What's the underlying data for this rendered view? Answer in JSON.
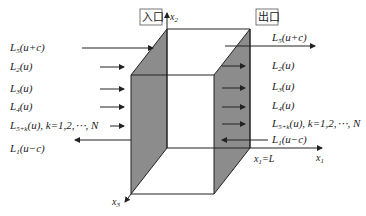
{
  "diagram": {
    "inlet_label": "入口",
    "outlet_label": "出口",
    "axes": {
      "x1": "x",
      "x1_sub": "1",
      "x2": "x",
      "x2_sub": "2",
      "x3": "x",
      "x3_sub": "3",
      "boundary": "x",
      "boundary_sub": "1",
      "boundary_value": "=L"
    },
    "left_waves": [
      {
        "L": "L",
        "sub": "5",
        "arg": "(u+c)",
        "direction": "in"
      },
      {
        "L": "L",
        "sub": "2",
        "arg": "(u)",
        "direction": "in"
      },
      {
        "L": "L",
        "sub": "3",
        "arg": "(u)",
        "direction": "in"
      },
      {
        "L": "L",
        "sub": "4",
        "arg": "(u)",
        "direction": "in"
      },
      {
        "L": "L",
        "sub": "5+k",
        "arg": "(u)",
        "suffix": ",  k=1,2,⋯, N",
        "direction": "in"
      },
      {
        "L": "L",
        "sub": "1",
        "arg": "(u−c)",
        "direction": "out"
      }
    ],
    "right_waves": [
      {
        "L": "L",
        "sub": "5",
        "arg": "(u+c)",
        "direction": "out"
      },
      {
        "L": "L",
        "sub": "2",
        "arg": "(u)",
        "direction": "out"
      },
      {
        "L": "L",
        "sub": "3",
        "arg": "(u)",
        "direction": "out"
      },
      {
        "L": "L",
        "sub": "4",
        "arg": "(u)",
        "direction": "out"
      },
      {
        "L": "L",
        "sub": "5+k",
        "arg": "(u)",
        "suffix": ",  k=1,2,⋯, N",
        "direction": "out"
      },
      {
        "L": "L",
        "sub": "1",
        "arg": "(u−c)",
        "direction": "in"
      }
    ],
    "colors": {
      "shaded_face": "#8c8c8c",
      "line": "#222222"
    }
  }
}
